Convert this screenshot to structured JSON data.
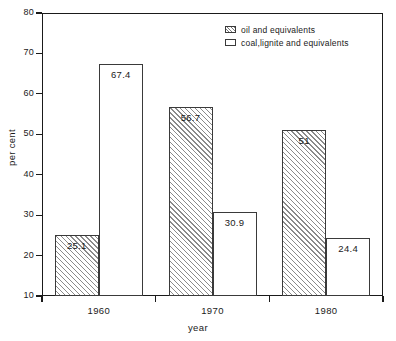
{
  "chart_data": {
    "type": "bar",
    "title": "",
    "subtitle": "",
    "xlabel": "year",
    "ylabel": "per cent",
    "categories": [
      "1960",
      "1970",
      "1980"
    ],
    "series": [
      {
        "name": "oil and equivalents",
        "style": "hatched",
        "values": [
          25.1,
          56.7,
          51
        ],
        "labels": [
          "25.1",
          "56.7",
          "51"
        ]
      },
      {
        "name": "coal,lignite and equivalents",
        "style": "open",
        "values": [
          67.4,
          30.9,
          24.4
        ],
        "labels": [
          "67.4",
          "30.9",
          "24.4"
        ]
      }
    ],
    "ylim": [
      10,
      80
    ],
    "yticks": [
      10,
      20,
      30,
      40,
      50,
      60,
      70,
      80
    ],
    "ytick_labels": [
      "10",
      "20",
      "30",
      "40",
      "50",
      "60",
      "70",
      "80"
    ],
    "grid": false,
    "legend_position": "top-right",
    "colors": {
      "axis": "#1a1a1a",
      "bar_edge": "#3a3a3a",
      "hatch": "#8a8a8a",
      "bar_fill": "#ffffff",
      "background": "#ffffff"
    }
  },
  "legend": {
    "entries": [
      {
        "label": "oil and equivalents"
      },
      {
        "label": "coal,lignite and equivalents"
      }
    ]
  }
}
